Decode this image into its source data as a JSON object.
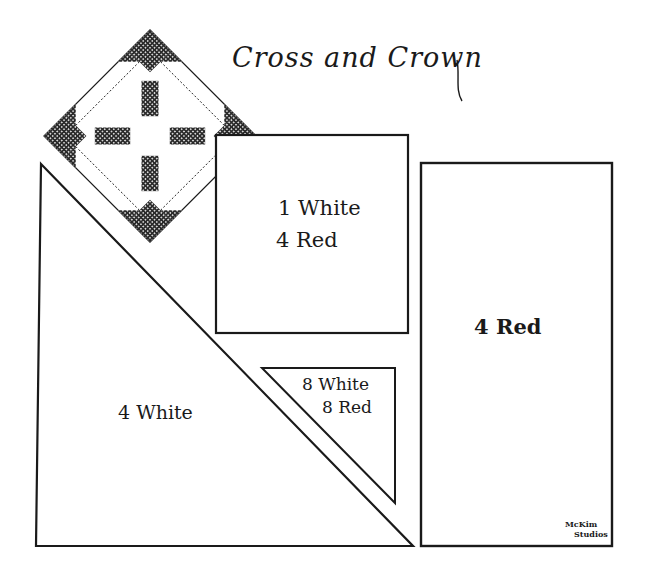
{
  "title": "Cross and Crown",
  "pieces": {
    "square": {
      "line1": "1 White",
      "line2": "4 Red"
    },
    "rectangle": {
      "label": "4 Red"
    },
    "large_triangle": {
      "label": "4 White"
    },
    "small_triangle": {
      "line1": "8 White",
      "line2": "8 Red"
    }
  },
  "signature": {
    "line1": "McKim",
    "line2": "Studios"
  },
  "colors": {
    "ink": "#1a1a1a",
    "paper": "#ffffff"
  }
}
